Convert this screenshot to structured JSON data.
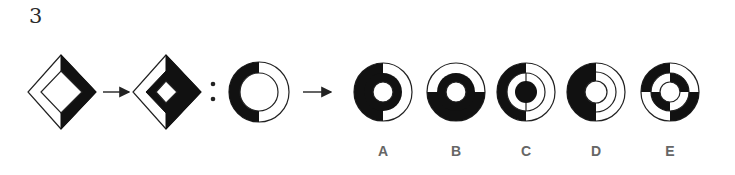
{
  "question": {
    "number": "3",
    "type": "figure-analogy",
    "prompt_sequence": [
      "diamond-source",
      "arrow",
      "diamond-result",
      "colon",
      "ring-source",
      "arrow",
      "?"
    ]
  },
  "colors": {
    "fill_black": "#111111",
    "stroke": "#222222",
    "background": "#ffffff",
    "label_gray": "#666666"
  },
  "figures": {
    "diamond_source": {
      "description": "Diamond with outer band; outer band right half black, left half white; inner diamond white"
    },
    "diamond_result": {
      "description": "Diamond with outer band (right black, left white), middle band fully black, innermost diamond white"
    },
    "ring_source": {
      "description": "Ring with outer band left half black, right half white; inner circle white"
    }
  },
  "options": [
    {
      "label": "A",
      "description": "Outer band left black/right white; middle band fully black; center white"
    },
    {
      "label": "B",
      "description": "Outer band top white/bottom black; middle band fully black; center white"
    },
    {
      "label": "C",
      "description": "Outer band left black/right white; middle band white; center black"
    },
    {
      "label": "D",
      "description": "Left half entirely black; right half white with three concentric rings"
    },
    {
      "label": "E",
      "description": "Outer and middle bands split into checkerboard quadrants; center white"
    }
  ]
}
